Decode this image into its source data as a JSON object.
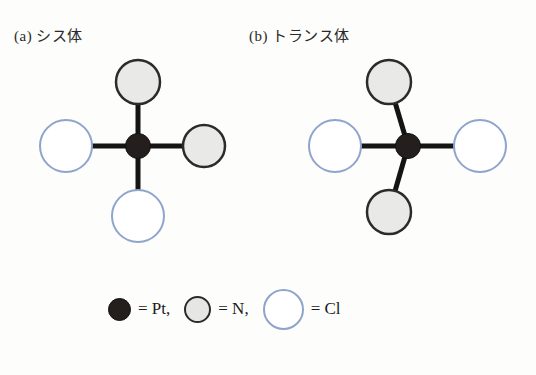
{
  "figure": {
    "structures": [
      {
        "id": "cis",
        "label": "(a) シス体",
        "center": {
          "x": 138,
          "y": 146,
          "r": 12,
          "atom": "Pt"
        },
        "atoms": [
          {
            "atom": "N",
            "position": "top",
            "x": 138,
            "y": 82,
            "r": 22
          },
          {
            "atom": "N",
            "position": "right",
            "x": 204,
            "y": 146,
            "r": 21
          },
          {
            "atom": "Cl",
            "position": "left",
            "x": 66,
            "y": 146,
            "r": 26
          },
          {
            "atom": "Cl",
            "position": "bottom",
            "x": 138,
            "y": 216,
            "r": 26
          }
        ]
      },
      {
        "id": "trans",
        "label": "(b) トランス体",
        "center": {
          "x": 408,
          "y": 146,
          "r": 12,
          "atom": "Pt"
        },
        "atoms": [
          {
            "atom": "N",
            "position": "top",
            "x": 389,
            "y": 82,
            "r": 22
          },
          {
            "atom": "N",
            "position": "bottom",
            "x": 389,
            "y": 212,
            "r": 22
          },
          {
            "atom": "Cl",
            "position": "left",
            "x": 335,
            "y": 146,
            "r": 26
          },
          {
            "atom": "Cl",
            "position": "right",
            "x": 480,
            "y": 146,
            "r": 26
          }
        ]
      }
    ],
    "legend": [
      {
        "symbol": "pt-circle",
        "text": "= Pt,"
      },
      {
        "symbol": "n-circle",
        "text": "= N,"
      },
      {
        "symbol": "cl-circle",
        "text": "= Cl"
      }
    ],
    "colors": {
      "pt_fill": "#241f1c",
      "n_fill": "#e6e6e4",
      "n_stroke": "#2b2b2b",
      "cl_fill": "#ffffff",
      "cl_stroke": "#8fa4cc",
      "bond": "#141414",
      "background": "#fdfdfb"
    }
  }
}
